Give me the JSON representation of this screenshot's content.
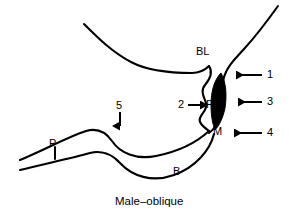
{
  "figure": {
    "caption": "Male–oblique",
    "background_color": "#ffffff",
    "stroke_color": "#000000",
    "fill_color": "#000000",
    "width": 294,
    "height": 216
  },
  "anatomy_labels": [
    {
      "id": "bl",
      "text": "BL",
      "x": 196,
      "y": 46
    },
    {
      "id": "po",
      "text": "Po",
      "x": 206,
      "y": 99
    },
    {
      "id": "m",
      "text": "M",
      "x": 213,
      "y": 126
    },
    {
      "id": "b",
      "text": "B",
      "x": 173,
      "y": 166
    },
    {
      "id": "p",
      "text": "P",
      "x": 49,
      "y": 138
    }
  ],
  "callouts": [
    {
      "id": "callout-1",
      "number": "1",
      "x": 267,
      "y": 69,
      "arrow_direction": "left",
      "arrow_y": 75,
      "arrow_from_x": 262,
      "arrow_to_x": 228
    },
    {
      "id": "callout-2",
      "number": "2",
      "x": 178,
      "y": 99,
      "arrow_direction": "right",
      "arrow_y": 105,
      "arrow_from_x": 188,
      "arrow_to_x": 204
    },
    {
      "id": "callout-3",
      "number": "3",
      "x": 267,
      "y": 96,
      "arrow_direction": "left",
      "arrow_y": 102,
      "arrow_from_x": 262,
      "arrow_to_x": 232
    },
    {
      "id": "callout-4",
      "number": "4",
      "x": 267,
      "y": 127,
      "arrow_direction": "left",
      "arrow_y": 133,
      "arrow_from_x": 262,
      "arrow_to_x": 227
    },
    {
      "id": "callout-5",
      "number": "5",
      "x": 116,
      "y": 100,
      "arrow_direction": "down",
      "arrow_x": 120,
      "arrow_from_y": 112,
      "arrow_to_y": 131
    }
  ],
  "icons": {
    "arrow_left": "←",
    "arrow_right": "→",
    "arrow_down": "↓"
  }
}
